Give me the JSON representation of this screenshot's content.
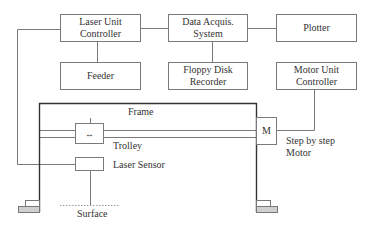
{
  "diagram": {
    "boxes": {
      "laser_unit_controller": "Laser Unit\nController",
      "feeder": "Feeder",
      "data_acquis_system": "Data Acquis.\nSystem",
      "floppy_disk_recorder": "Floppy Disk\nRecorder",
      "plotter": "Plotter",
      "motor_unit_controller": "Motor Unit\nController",
      "trolley_symbol": "↔",
      "motor_symbol": "M"
    },
    "labels": {
      "frame": "Frame",
      "trolley": "Trolley",
      "laser_sensor": "Laser Sensor",
      "surface": "Surface",
      "step_motor": "Step by step\nMotor"
    }
  }
}
